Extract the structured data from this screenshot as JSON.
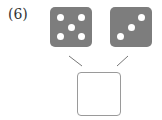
{
  "problem": {
    "label": "(6)",
    "dice": [
      {
        "name": "left-die",
        "value": 5,
        "color": "#7d7d7d",
        "pip_color": "#ffffff"
      },
      {
        "name": "right-die",
        "value": 3,
        "color": "#7d7d7d",
        "pip_color": "#ffffff"
      }
    ],
    "answer_box": {
      "value": ""
    },
    "line_color": "#777777"
  }
}
